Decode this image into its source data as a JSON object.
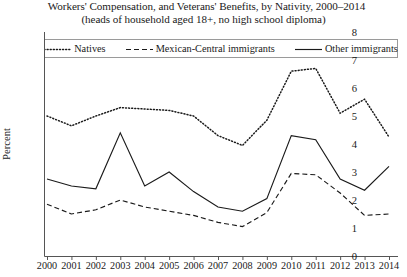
{
  "chart_data": {
    "type": "line",
    "title": "Workers' Compensation, and Veterans' Benefits, by Nativity, 2000–2014",
    "subtitle": "(heads of household aged 18+, no high school diploma)",
    "xlabel": "",
    "ylabel": "Percent",
    "ylim": [
      0,
      8
    ],
    "yticks": [
      0,
      1,
      2,
      3,
      4,
      5,
      6,
      7,
      8
    ],
    "grid": false,
    "legend_position": "top-inside",
    "categories": [
      2000,
      2001,
      2002,
      2003,
      2004,
      2005,
      2006,
      2007,
      2008,
      2009,
      2010,
      2011,
      2012,
      2013,
      2014
    ],
    "x": [
      "2000",
      "2001",
      "2002",
      "2003",
      "2004",
      "2005",
      "2006",
      "2007",
      "2008",
      "2009",
      "2010",
      "2011",
      "2012",
      "2013",
      "2014"
    ],
    "series": [
      {
        "name": "Natives",
        "style": "dotted",
        "color": "#1a1a1a",
        "values": [
          5.0,
          4.65,
          5.0,
          5.3,
          5.25,
          5.2,
          5.0,
          4.3,
          3.95,
          4.85,
          6.6,
          6.7,
          5.1,
          5.6,
          4.25
        ]
      },
      {
        "name": "Mexican-Central immigrants",
        "style": "dashed",
        "color": "#1a1a1a",
        "values": [
          1.85,
          1.5,
          1.65,
          2.0,
          1.75,
          1.6,
          1.45,
          1.2,
          1.05,
          1.55,
          2.95,
          2.9,
          2.25,
          1.45,
          1.5
        ]
      },
      {
        "name": "Other immigrants",
        "style": "solid",
        "color": "#1a1a1a",
        "values": [
          2.75,
          2.5,
          2.4,
          4.4,
          2.5,
          3.0,
          2.3,
          1.75,
          1.6,
          2.05,
          4.3,
          4.15,
          2.75,
          2.35,
          3.2
        ]
      }
    ]
  },
  "legend": {
    "items": [
      {
        "label": "Natives",
        "style": "dotted"
      },
      {
        "label": "Mexican-Central immigrants",
        "style": "dashed"
      },
      {
        "label": "Other immigrants",
        "style": "solid"
      }
    ]
  }
}
